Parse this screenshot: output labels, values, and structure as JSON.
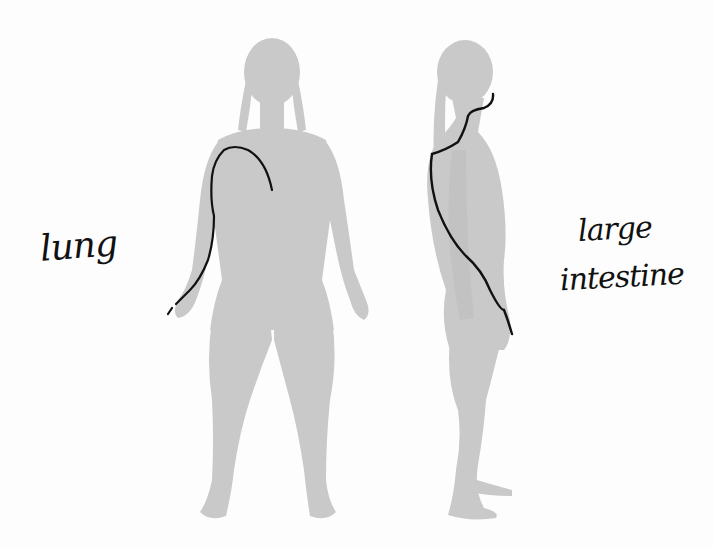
{
  "figure": {
    "views": [
      {
        "id": "front",
        "description": "front-view female silhouette"
      },
      {
        "id": "side",
        "description": "side-view female silhouette"
      }
    ],
    "labels": {
      "front": "lung",
      "side_line1": "large",
      "side_line2": "intestine"
    },
    "colors": {
      "silhouette": "#c8c8c8",
      "meridian_line": "#111111",
      "background": "#fdfdfd"
    }
  }
}
